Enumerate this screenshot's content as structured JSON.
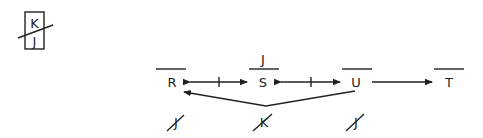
{
  "legend": {
    "top_letter": "K",
    "bottom_letter": "J",
    "crossed": true
  },
  "nodes": [
    {
      "id": "R",
      "label": "R",
      "overline": true,
      "above": ""
    },
    {
      "id": "S",
      "label": "S",
      "overline": true,
      "above": "J"
    },
    {
      "id": "U",
      "label": "U",
      "overline": true,
      "above": ""
    },
    {
      "id": "T",
      "label": "T",
      "overline": true,
      "above": ""
    }
  ],
  "edges": [
    {
      "from": "R",
      "to": "S",
      "type": "bidirectional",
      "tick": true
    },
    {
      "from": "S",
      "to": "U",
      "type": "bidirectional",
      "tick": true
    },
    {
      "from": "U",
      "to": "T",
      "type": "directed",
      "tick": false
    },
    {
      "from": "U",
      "to": "R",
      "type": "directed-bent",
      "tick": false
    }
  ],
  "bottom_marks": [
    {
      "label": "J",
      "under": "R",
      "crossed": true
    },
    {
      "label": "K",
      "under": "S",
      "crossed": true
    },
    {
      "label": "J",
      "under": "U",
      "crossed": true
    }
  ],
  "colors": {
    "ink": "#222222",
    "background": "#ffffff"
  }
}
